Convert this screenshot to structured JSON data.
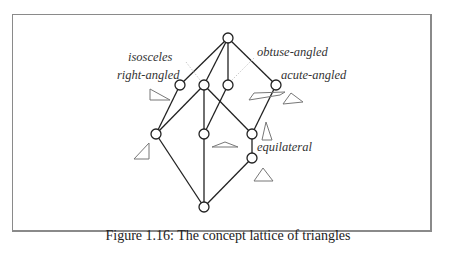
{
  "figure": {
    "caption": "Figure 1.16: The concept lattice of triangles",
    "labels": {
      "isosceles": "isosceles",
      "right_angled": "right-angled",
      "obtuse_angled": "obtuse-angled",
      "acute_angled": "acute-angled",
      "equilateral": "equilateral"
    }
  },
  "diagram": {
    "type": "concept-lattice",
    "nodes": [
      {
        "id": "top",
        "x": 228,
        "y": 38
      },
      {
        "id": "right-angled",
        "x": 180,
        "y": 85
      },
      {
        "id": "isosceles",
        "x": 204,
        "y": 85
      },
      {
        "id": "obtuse-angled",
        "x": 228,
        "y": 85
      },
      {
        "id": "acute-angled",
        "x": 276,
        "y": 85
      },
      {
        "id": "right-isosceles",
        "x": 156,
        "y": 134
      },
      {
        "id": "obtuse-isosceles",
        "x": 204,
        "y": 134
      },
      {
        "id": "acute-isosceles",
        "x": 252,
        "y": 134
      },
      {
        "id": "equilateral",
        "x": 252,
        "y": 158
      },
      {
        "id": "bottom",
        "x": 204,
        "y": 207
      }
    ],
    "edges": [
      [
        "top",
        "right-angled"
      ],
      [
        "top",
        "isosceles"
      ],
      [
        "top",
        "obtuse-angled"
      ],
      [
        "top",
        "acute-angled"
      ],
      [
        "right-angled",
        "right-isosceles"
      ],
      [
        "isosceles",
        "right-isosceles"
      ],
      [
        "isosceles",
        "obtuse-isosceles"
      ],
      [
        "isosceles",
        "acute-isosceles"
      ],
      [
        "obtuse-angled",
        "obtuse-isosceles"
      ],
      [
        "acute-angled",
        "acute-isosceles"
      ],
      [
        "acute-isosceles",
        "equilateral"
      ],
      [
        "right-isosceles",
        "bottom"
      ],
      [
        "obtuse-isosceles",
        "bottom"
      ],
      [
        "equilateral",
        "bottom"
      ]
    ]
  }
}
